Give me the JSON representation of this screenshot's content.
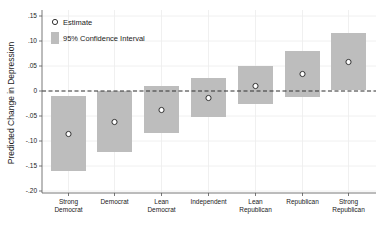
{
  "chart_data": {
    "type": "scatter",
    "subtype": "point-estimate-with-confidence-interval-bars",
    "title": "",
    "xlabel": "",
    "ylabel": "Predicted Change in Depression",
    "ylim": [
      -0.2,
      0.15
    ],
    "yticks": [
      0.15,
      0.1,
      0.05,
      0,
      -0.05,
      -0.1,
      -0.15,
      -0.2
    ],
    "ytick_labels": [
      ".15",
      ".10",
      ".05",
      "0",
      "-.05",
      "-.10",
      "-.15",
      "-.20"
    ],
    "categories": [
      "Strong Democrat",
      "Democrat",
      "Lean Democrat",
      "Independent",
      "Lean Republican",
      "Republican",
      "Strong Republican"
    ],
    "category_labels": [
      [
        "Strong",
        "Democrat"
      ],
      [
        "Democrat"
      ],
      [
        "Lean",
        "Democrat"
      ],
      [
        "Independent"
      ],
      [
        "Lean",
        "Republican"
      ],
      [
        "Republican"
      ],
      [
        "Strong",
        "Republican"
      ]
    ],
    "series": [
      {
        "name": "Estimate",
        "values": [
          -0.086,
          -0.062,
          -0.038,
          -0.014,
          0.01,
          0.034,
          0.058
        ]
      },
      {
        "name": "95% Confidence Interval",
        "lower": [
          -0.16,
          -0.122,
          -0.084,
          -0.052,
          -0.026,
          -0.012,
          0.002
        ],
        "upper": [
          -0.01,
          0.0,
          0.01,
          0.026,
          0.05,
          0.08,
          0.116
        ]
      }
    ],
    "reference_line": {
      "y": 0,
      "style": "dashed"
    },
    "grid": true,
    "legend": {
      "position": "top-left",
      "entries": [
        "Estimate",
        "95% Confidence Interval"
      ]
    }
  },
  "colors": {
    "ci_bar": "#bdbdbd",
    "marker_fill": "#ffffff",
    "marker_stroke": "#333333",
    "axis": "#555555",
    "grid": "#ececec",
    "reference_line": "#333333"
  }
}
